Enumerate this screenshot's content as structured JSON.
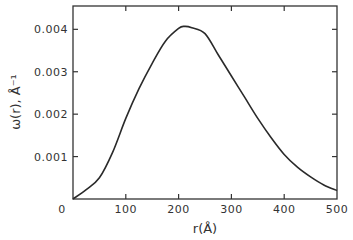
{
  "chart_data": {
    "type": "line",
    "title": "",
    "xlabel": "r(Å)",
    "ylabel": "ω(r), Å⁻¹",
    "xlim": [
      0,
      500
    ],
    "ylim": [
      0,
      0.0045
    ],
    "x_ticks": [
      0,
      100,
      200,
      300,
      400,
      500
    ],
    "x_tick_labels": [
      "0",
      "100",
      "200",
      "300",
      "400",
      "500"
    ],
    "y_ticks": [
      0.001,
      0.002,
      0.003,
      0.004
    ],
    "y_tick_labels": [
      "0.001",
      "0.002",
      "0.003",
      "0.004"
    ],
    "grid": false,
    "legend": null,
    "series": [
      {
        "name": "ω(r)",
        "x": [
          0,
          25,
          50,
          75,
          100,
          125,
          150,
          175,
          200,
          211,
          225,
          250,
          275,
          300,
          325,
          350,
          375,
          400,
          425,
          450,
          475,
          500
        ],
        "y": [
          0.0,
          0.00022,
          0.0005,
          0.0011,
          0.0019,
          0.0026,
          0.0032,
          0.00372,
          0.00402,
          0.00407,
          0.00404,
          0.0039,
          0.0034,
          0.0029,
          0.0024,
          0.0019,
          0.00145,
          0.00105,
          0.00075,
          0.00052,
          0.00033,
          0.0002
        ]
      }
    ]
  }
}
